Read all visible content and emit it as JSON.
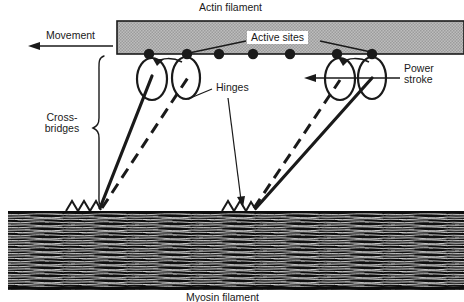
{
  "figure": {
    "background_color": "#ffffff",
    "width": 464,
    "height": 302
  },
  "labels": {
    "actin_filament": "Actin filament",
    "movement": "Movement",
    "active_sites": "Active sites",
    "hinges": "Hinges",
    "power_stroke_line1": "Power",
    "power_stroke_line2": "stroke",
    "crossbridges_line1": "Cross-",
    "crossbridges_line2": "bridges",
    "myosin_filament": "Myosin filament"
  },
  "colors": {
    "ink": "#1a1a1a",
    "actin_fill": "#b9b9b9",
    "actin_stroke": "#1a1a1a",
    "myosin_dark": "#141414",
    "paper": "#ffffff"
  },
  "diagram": {
    "actin_bar": {
      "x": 117,
      "y": 21,
      "width": 347,
      "height": 33
    },
    "active_site_dots_x": [
      149,
      187,
      219,
      253,
      290,
      337,
      372
    ],
    "active_site_dot_y": 54,
    "active_site_dot_r": 5.2,
    "myosin_band": {
      "x": 8,
      "y": 212,
      "width": 456,
      "height": 78
    },
    "anchor_left_x": 100,
    "anchor_right_x": 256,
    "anchor_y": 208,
    "movement_arrow": {
      "x1": 113,
      "y1": 46,
      "x2": 30,
      "y2": 46
    },
    "power_stroke_arrow": {
      "x1": 400,
      "y1": 78,
      "x2": 306,
      "y2": 78
    },
    "crossbridge_brace": {
      "x": 97,
      "y_top": 56,
      "y_bottom": 207
    },
    "head_ellipse_rx": 15,
    "head_ellipse_ry": 21
  }
}
